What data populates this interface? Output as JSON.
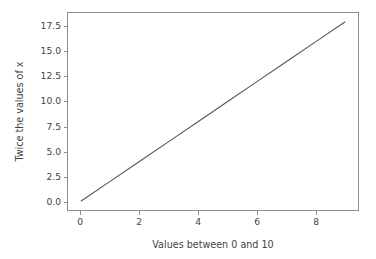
{
  "chart_data": {
    "type": "line",
    "title": "",
    "xlabel": "Values between 0 and 10",
    "ylabel": "Twice the values of x",
    "x": [
      0,
      1,
      2,
      3,
      4,
      5,
      6,
      7,
      8,
      9
    ],
    "series": [
      {
        "name": "2x",
        "values": [
          0,
          2,
          4,
          6,
          8,
          10,
          12,
          14,
          16,
          18
        ],
        "color": "#555555",
        "linewidth": 1
      }
    ],
    "xlim": [
      -0.45,
      9.45
    ],
    "ylim": [
      -0.9,
      18.9
    ],
    "xticks": [
      0,
      2,
      4,
      6,
      8
    ],
    "xticklabels": [
      "0",
      "2",
      "4",
      "6",
      "8"
    ],
    "yticks": [
      0.0,
      2.5,
      5.0,
      7.5,
      10.0,
      12.5,
      15.0,
      17.5
    ],
    "yticklabels": [
      "0.0",
      "2.5",
      "5.0",
      "7.5",
      "10.0",
      "12.5",
      "15.0",
      "17.5"
    ],
    "grid": false,
    "legend": null,
    "legend_position": "none",
    "annotations": [],
    "axes_frame": true,
    "background_color": "#ffffff",
    "axes_edge_color": "#8d8d8d",
    "tick_label_color": "#444444",
    "axis_label_color": "#444444"
  }
}
